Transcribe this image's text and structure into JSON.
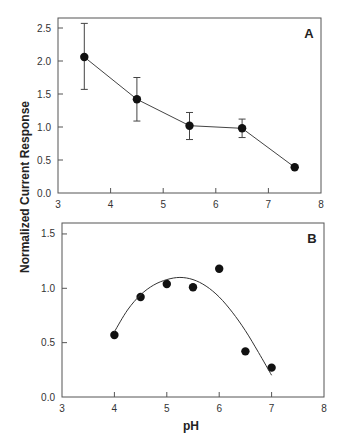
{
  "chart_data": [
    {
      "panel": "A",
      "type": "line",
      "title": "",
      "xlabel": "",
      "ylabel": "Normalized Current Response",
      "xlim": [
        3,
        8
      ],
      "ylim": [
        0.0,
        2.6
      ],
      "xticks": [
        "3",
        "4",
        "5",
        "6",
        "7",
        "8"
      ],
      "yticks": [
        "0.0",
        "0.5",
        "1.0",
        "1.5",
        "2.0",
        "2.5"
      ],
      "grid": false,
      "series": [
        {
          "name": "A",
          "x": [
            3.5,
            4.5,
            5.5,
            6.5,
            7.5
          ],
          "y": [
            2.06,
            1.42,
            1.02,
            0.98,
            0.39
          ],
          "error_low": [
            1.57,
            1.09,
            0.81,
            0.84,
            0.39
          ],
          "error_high": [
            2.57,
            1.75,
            1.22,
            1.12,
            0.39
          ]
        }
      ],
      "annotation": "A"
    },
    {
      "panel": "B",
      "type": "scatter",
      "title": "",
      "xlabel": "pH",
      "ylabel": "Normalized Current Response",
      "xlim": [
        3,
        8
      ],
      "ylim": [
        0.0,
        1.6
      ],
      "xticks": [
        "3",
        "4",
        "5",
        "6",
        "7",
        "8"
      ],
      "yticks": [
        "0.0",
        "0.5",
        "1.0",
        "1.5"
      ],
      "grid": false,
      "series": [
        {
          "name": "B data",
          "x": [
            4.0,
            4.5,
            5.0,
            5.5,
            6.0,
            6.5,
            7.0
          ],
          "y": [
            0.57,
            0.92,
            1.04,
            1.01,
            1.18,
            0.42,
            0.27
          ]
        },
        {
          "name": "B fit",
          "type": "curve",
          "x": [
            4.0,
            4.25,
            4.5,
            4.75,
            5.0,
            5.25,
            5.5,
            5.75,
            6.0,
            6.25,
            6.5,
            6.75,
            7.0
          ],
          "y": [
            0.6,
            0.8,
            0.94,
            1.03,
            1.08,
            1.1,
            1.08,
            1.02,
            0.92,
            0.78,
            0.61,
            0.41,
            0.2
          ]
        }
      ],
      "annotation": "B"
    }
  ],
  "labels": {
    "ylabel": "Normalized Current Response",
    "xlabel": "pH",
    "panel_a": "A",
    "panel_b": "B"
  }
}
